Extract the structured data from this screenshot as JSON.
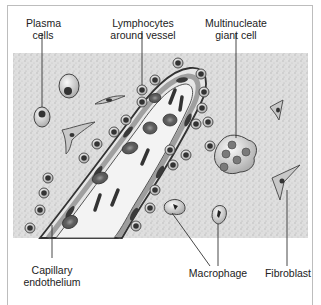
{
  "figure": {
    "type": "histology illustration",
    "colors": {
      "background": "#ffffff",
      "stroma": "#d9d9d9",
      "cell_fill": "#cfcfcf",
      "nucleus": "#3a3a3a",
      "red_cell": "#7a7a7a",
      "vessel_lumen": "#f2f2f2",
      "leader_line": "#333333",
      "frame": "#bdbdbd"
    },
    "labels": {
      "plasma_cells": {
        "line1": "Plasma",
        "line2": "cells"
      },
      "lymphocytes": {
        "line1": "Lymphocytes",
        "line2": "around vessel"
      },
      "giant_cell": {
        "line1": "Multinucleate",
        "line2": "giant cell"
      },
      "capillary": {
        "line1": "Capillary",
        "line2": "endothelium"
      },
      "macrophage": {
        "line1": "Macrophage"
      },
      "fibroblast": {
        "line1": "Fibroblast"
      }
    }
  }
}
